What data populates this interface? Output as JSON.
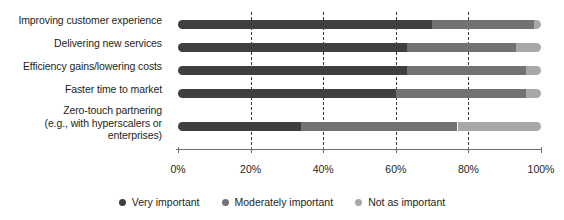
{
  "chart_data": {
    "type": "bar",
    "orientation": "horizontal",
    "stacked": true,
    "stacked_normalized": true,
    "title": "",
    "subtitle": "",
    "xlabel": "",
    "ylabel": "",
    "xlim": [
      0,
      100
    ],
    "grid": true,
    "grid_axis": "x",
    "grid_style": "dashed",
    "legend_position": "bottom",
    "categories": [
      "Improving customer experience",
      "Delivering new services",
      "Efficiency gains/lowering costs",
      "Faster time to market",
      "Zero-touch partnering (e.g., with hyperscalers or enterprises)"
    ],
    "category_label_lines": [
      [
        "Improving customer experience"
      ],
      [
        "Delivering new services"
      ],
      [
        "Efficiency gains/lowering costs"
      ],
      [
        "Faster time to market"
      ],
      [
        "Zero-touch partnering",
        "(e.g., with hyperscalers or",
        "enterprises)"
      ]
    ],
    "xticks": [
      0,
      20,
      40,
      60,
      80,
      100
    ],
    "xticklabels": [
      "0%",
      "20%",
      "40%",
      "60%",
      "80%",
      "100%"
    ],
    "gridlines": [
      20,
      40,
      60,
      80
    ],
    "series": [
      {
        "name": "Very important",
        "color": "#3f3f3f",
        "values": [
          70,
          63,
          63,
          60,
          34
        ]
      },
      {
        "name": "Moderately important",
        "color": "#727272",
        "values": [
          28,
          30,
          33,
          36,
          43
        ]
      },
      {
        "name": "Not as important",
        "color": "#a8a8a8",
        "values": [
          2,
          7,
          4,
          4,
          23
        ]
      }
    ]
  },
  "legend": {
    "items": [
      {
        "label": "Very important",
        "color": "#3f3f3f"
      },
      {
        "label": "Moderately important",
        "color": "#727272"
      },
      {
        "label": "Not as important",
        "color": "#a8a8a8"
      }
    ]
  }
}
